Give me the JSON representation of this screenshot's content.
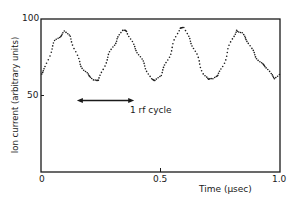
{
  "chart_data": {
    "type": "scatter",
    "title": "",
    "xlabel": "Time (μsec)",
    "ylabel": "Ion current (arbitrary units)",
    "xlim": [
      0,
      1.0
    ],
    "ylim": [
      0,
      100
    ],
    "x_ticks": [
      "0",
      "0.5",
      "1.0"
    ],
    "y_ticks": [
      "50",
      "100"
    ],
    "y_zero_label": "0",
    "grid": false,
    "legend": null,
    "annotation": {
      "text": "1 rf cycle",
      "arrow_from_x": 0.15,
      "arrow_to_x": 0.39,
      "arrow_y": 50
    },
    "series": [
      {
        "name": "ion current",
        "style": "dotted points",
        "x": [
          0.0,
          0.02,
          0.04,
          0.06,
          0.08,
          0.1,
          0.12,
          0.14,
          0.16,
          0.18,
          0.2,
          0.22,
          0.24,
          0.26,
          0.28,
          0.3,
          0.32,
          0.34,
          0.36,
          0.38,
          0.4,
          0.42,
          0.44,
          0.46,
          0.48,
          0.5,
          0.52,
          0.54,
          0.56,
          0.58,
          0.6,
          0.62,
          0.64,
          0.66,
          0.68,
          0.7,
          0.72,
          0.74,
          0.76,
          0.78,
          0.8,
          0.82,
          0.84,
          0.86,
          0.88,
          0.9,
          0.92,
          0.94,
          0.96,
          0.98,
          1.0
        ],
        "y": [
          64,
          70,
          78,
          85,
          89,
          93,
          88,
          80,
          73,
          67,
          62,
          60,
          61,
          67,
          74,
          82,
          88,
          92,
          91,
          86,
          80,
          73,
          67,
          62,
          60,
          62,
          70,
          78,
          86,
          93,
          95,
          88,
          80,
          72,
          65,
          61,
          60,
          63,
          70,
          78,
          86,
          93,
          92,
          86,
          80,
          76,
          72,
          68,
          64,
          62,
          65
        ]
      }
    ]
  }
}
